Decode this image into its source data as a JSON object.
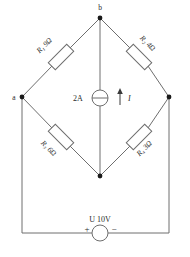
{
  "diagram": {
    "colors": {
      "wire": "#6e6e6e",
      "node": "#1a1a1a",
      "text": "#2b2b2b",
      "background": "#ffffff"
    },
    "nodes": [
      {
        "id": "a",
        "label": "a",
        "x": 22,
        "y": 97,
        "labeled": true
      },
      {
        "id": "b",
        "label": "b",
        "x": 100,
        "y": 18,
        "labeled": true
      },
      {
        "id": "right",
        "label": "",
        "x": 169,
        "y": 97,
        "labeled": false
      },
      {
        "id": "bottom",
        "label": "",
        "x": 100,
        "y": 176,
        "labeled": false
      }
    ],
    "resistors": [
      {
        "id": "R1",
        "name": "R",
        "subscript": "1",
        "value": "9",
        "unit": "Ω",
        "label": "R₁ 9Ω",
        "branch": "a-b"
      },
      {
        "id": "R2",
        "name": "R",
        "subscript": "2",
        "value": "4",
        "unit": "Ω",
        "label": "R₂ 4Ω",
        "branch": "b-right"
      },
      {
        "id": "R3",
        "name": "R",
        "subscript": "3",
        "value": "6",
        "unit": "Ω",
        "label": "R₃ 6Ω",
        "branch": "a-bottom"
      },
      {
        "id": "R4",
        "name": "R",
        "subscript": "4",
        "value": "3",
        "unit": "Ω",
        "label": "R₄ 3Ω",
        "branch": "bottom-right"
      }
    ],
    "current_source": {
      "id": "I1",
      "value": "2A",
      "current_label": "I",
      "branch": "b-bottom",
      "direction": "up"
    },
    "voltage_source": {
      "id": "U1",
      "symbol": "U",
      "value": "10V",
      "label": "U 10V",
      "plus": "+",
      "minus": "−",
      "branch": "bottom-return"
    }
  }
}
